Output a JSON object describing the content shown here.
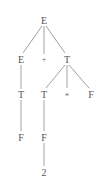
{
  "diagram": {
    "type": "parse-tree",
    "colors": {
      "text": "#555555",
      "edge": "#8a8a8a",
      "background": "#ffffff"
    },
    "nodes": {
      "n_root": {
        "label": "E",
        "x": 44,
        "y": 21
      },
      "n_e2": {
        "label": "E",
        "x": 21,
        "y": 60
      },
      "n_plus": {
        "label": "+",
        "x": 44,
        "y": 60
      },
      "n_t2": {
        "label": "T",
        "x": 67,
        "y": 60
      },
      "n_t3a": {
        "label": "T",
        "x": 21,
        "y": 95
      },
      "n_t3b": {
        "label": "T",
        "x": 44,
        "y": 95
      },
      "n_star": {
        "label": "*",
        "x": 67,
        "y": 95
      },
      "n_f3": {
        "label": "F",
        "x": 91,
        "y": 95
      },
      "n_f4a": {
        "label": "F",
        "x": 21,
        "y": 138
      },
      "n_f4b": {
        "label": "F",
        "x": 44,
        "y": 138
      },
      "n_two": {
        "label": "2",
        "x": 44,
        "y": 173
      }
    },
    "edges": [
      {
        "from": "n_root",
        "to": "n_e2"
      },
      {
        "from": "n_root",
        "to": "n_plus"
      },
      {
        "from": "n_root",
        "to": "n_t2"
      },
      {
        "from": "n_e2",
        "to": "n_t3a"
      },
      {
        "from": "n_t2",
        "to": "n_t3b"
      },
      {
        "from": "n_t2",
        "to": "n_star"
      },
      {
        "from": "n_t2",
        "to": "n_f3"
      },
      {
        "from": "n_t3a",
        "to": "n_f4a"
      },
      {
        "from": "n_t3b",
        "to": "n_f4b"
      },
      {
        "from": "n_f4b",
        "to": "n_two"
      }
    ]
  }
}
